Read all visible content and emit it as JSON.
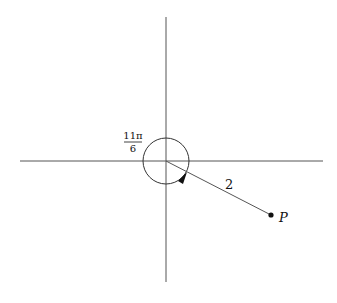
{
  "diagram": {
    "type": "polar-angle",
    "colors": {
      "line": "#555555",
      "ink": "#111111",
      "background": "#ffffff"
    },
    "origin": {
      "x": 166,
      "y": 161
    },
    "axes": {
      "horizontal": {
        "x1": 20,
        "x2": 323,
        "y": 161
      },
      "vertical": {
        "x": 166,
        "y1": 17,
        "y2": 282
      }
    },
    "angle": {
      "numerator": "11π",
      "denominator": "6",
      "label": "11π/6",
      "arc_radius": 23
    },
    "segment": {
      "length_label": "2"
    },
    "point": {
      "label": "P",
      "x": 271,
      "y": 215
    }
  }
}
